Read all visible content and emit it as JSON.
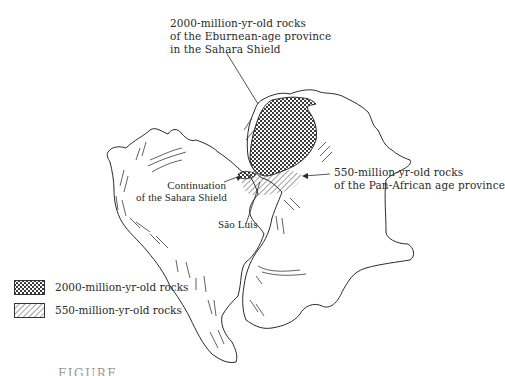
{
  "figure": {
    "labels": {
      "eburnean": [
        "2000-million-yr-old rocks",
        "of the Eburnean-age province",
        "in the Sahara Shield"
      ],
      "pan_african": [
        "550-million-yr-old rocks",
        "of the Pan-African age province"
      ],
      "continuation": [
        "Continuation",
        "of the Sahara Shield"
      ],
      "sao_luis": "São Luis"
    },
    "legend": [
      {
        "pattern": "crosshatch",
        "label": "2000-million-yr-old rocks"
      },
      {
        "pattern": "diagonal-hatch",
        "label": "550-million-yr-old rocks"
      }
    ],
    "landmasses": [
      {
        "name": "South America",
        "position": "left"
      },
      {
        "name": "Africa",
        "position": "right"
      }
    ],
    "caption_truncated": "FIGURE ..."
  },
  "colors": {
    "ink": "#2a2a2a",
    "background": "#ffffff",
    "crosshatch_fill": "#555555"
  }
}
